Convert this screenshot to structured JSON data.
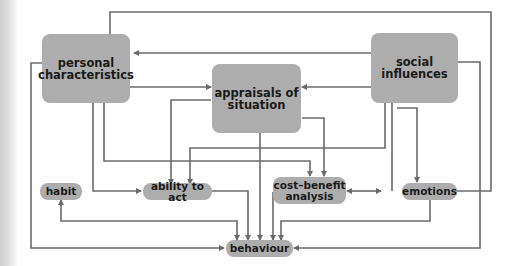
{
  "diagram": {
    "nodes": {
      "personal": "personal\ncharacteristics",
      "appraisals": "appraisals of\nsituation",
      "social": "social\ninfluences",
      "habit": "habit",
      "ability": "ability to act",
      "costbenefit": "cost–benefit\nanalysis",
      "emotions": "emotions",
      "behaviour": "behaviour"
    },
    "colors": {
      "node_fill": "#adadad",
      "line": "#6b6b6b",
      "text": "#1a1a1a"
    },
    "edges": [
      {
        "from": "personal characteristics",
        "to": "appraisals of situation"
      },
      {
        "from": "social influences",
        "to": "personal characteristics"
      },
      {
        "from": "social influences",
        "to": "appraisals of situation"
      },
      {
        "from": "personal characteristics",
        "to": "emotions"
      },
      {
        "from": "personal characteristics",
        "to": "behaviour"
      },
      {
        "from": "personal characteristics",
        "to": "ability to act"
      },
      {
        "from": "personal characteristics",
        "to": "cost-benefit analysis"
      },
      {
        "from": "appraisals of situation",
        "to": "ability to act"
      },
      {
        "from": "appraisals of situation",
        "to": "cost-benefit analysis"
      },
      {
        "from": "appraisals of situation",
        "to": "behaviour"
      },
      {
        "from": "social influences",
        "to": "ability to act"
      },
      {
        "from": "social influences",
        "to": "emotions"
      },
      {
        "from": "social influences",
        "to": "behaviour"
      },
      {
        "from": "cost-benefit analysis",
        "to": "emotions",
        "bidirectional": true
      },
      {
        "from": "ability to act",
        "to": "behaviour"
      },
      {
        "from": "cost-benefit analysis",
        "to": "behaviour"
      },
      {
        "from": "emotions",
        "to": "behaviour"
      },
      {
        "from": "behaviour",
        "to": "habit",
        "bidirectional": true
      }
    ]
  }
}
